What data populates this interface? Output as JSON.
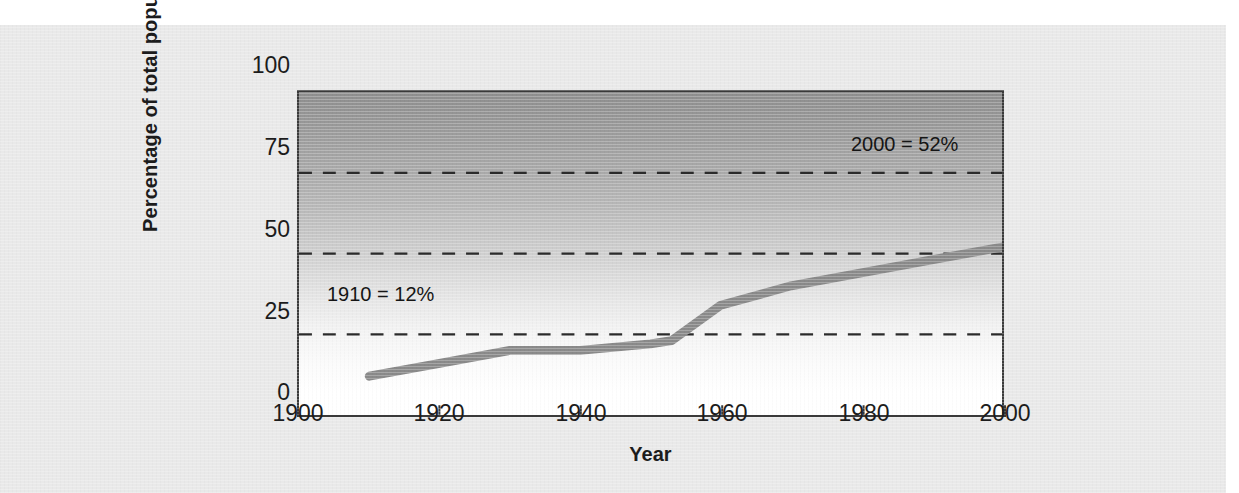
{
  "clipped_caption": "",
  "chart_data": {
    "type": "line",
    "title": "",
    "xlabel": "Year",
    "ylabel": "Percentage of total population",
    "xlim": [
      1900,
      2000
    ],
    "ylim": [
      0,
      100
    ],
    "xticks": [
      1900,
      1920,
      1940,
      1960,
      1980,
      2000
    ],
    "yticks": [
      0,
      25,
      50,
      75,
      100
    ],
    "grid": "horizontal dashed at 25, 50, 75",
    "legend": "none",
    "series": [
      {
        "name": "Percentage of total population",
        "x": [
          1910,
          1920,
          1930,
          1940,
          1950,
          1953,
          1960,
          1970,
          1980,
          1990,
          2000
        ],
        "values": [
          12,
          16,
          20,
          20,
          22,
          23,
          34,
          40,
          44,
          48,
          52
        ]
      }
    ],
    "annotations": [
      {
        "id": "annotation-1910",
        "text": "1910 = 12%",
        "x": 1910,
        "y": 25
      },
      {
        "id": "annotation-2000",
        "text": "2000 = 52%",
        "x": 2000,
        "y": 75
      }
    ],
    "colors": {
      "line": "#8a8a8a",
      "axis": "#3a3a3a",
      "gridline": "#2b2b2b",
      "plot_gradient_top": "#8e8e8e",
      "plot_gradient_bottom": "#ffffff",
      "figure_background": "#e9e9e9"
    }
  },
  "axes": {
    "y": {
      "title": "Percentage of total population",
      "tick_labels": [
        "100",
        "75",
        "50",
        "25",
        "0"
      ]
    },
    "x": {
      "title": "Year",
      "tick_labels": [
        "1900",
        "1920",
        "1940",
        "1960",
        "1980",
        "2000"
      ]
    }
  },
  "annotations": {
    "early": "1910 = 12%",
    "late": "2000 = 52%"
  }
}
